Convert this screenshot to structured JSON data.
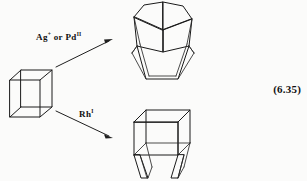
{
  "figure": {
    "type": "chemical-reaction-scheme",
    "equation_number": "(6.35)",
    "background_color": "#fbfbfa",
    "line_color": "#1a1a1a"
  },
  "reactant": {
    "name": "cubane-cage",
    "description": "cube"
  },
  "arrows": [
    {
      "name": "arrow-upper",
      "direction": "up-right",
      "label_prefix": "Ag",
      "label_sup1": "+",
      "label_middle": " or Pd",
      "label_sup2": "II",
      "label_plain": "Ag+ or PdII"
    },
    {
      "name": "arrow-lower",
      "direction": "down-right",
      "label_prefix": "Rh",
      "label_sup1": "I",
      "label_middle": "",
      "label_sup2": "",
      "label_plain": "RhI"
    }
  ],
  "products": [
    {
      "name": "cuneane-cage",
      "description": "folded bent cage"
    },
    {
      "name": "opened-cube-cage",
      "description": "cube with splayed open base"
    }
  ],
  "labels": {
    "upper_reagent": "Ag+ or PdII",
    "lower_reagent": "RhI",
    "equation": "(6.35)"
  }
}
